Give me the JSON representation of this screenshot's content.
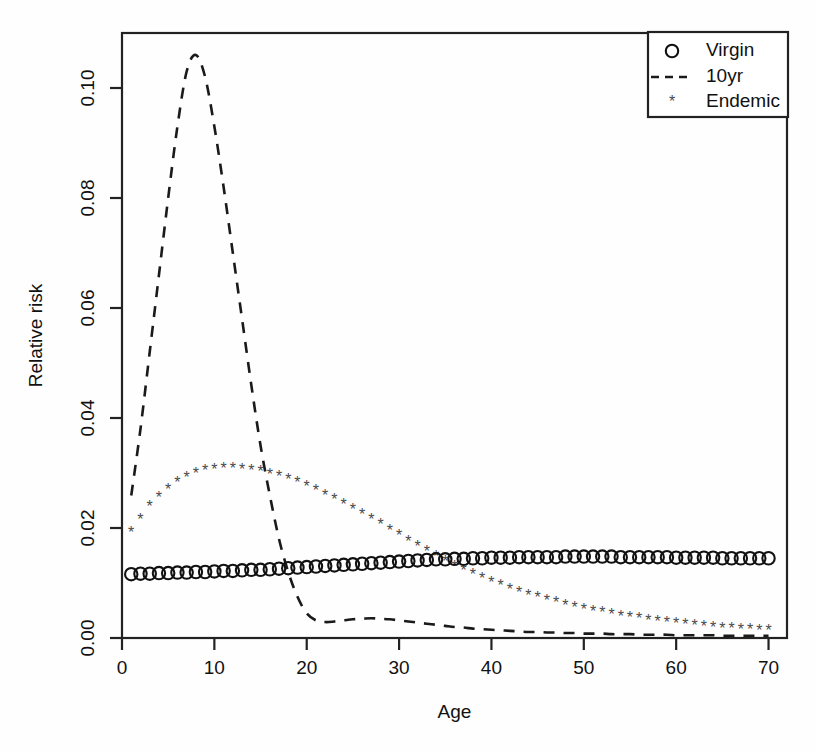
{
  "chart_data": {
    "type": "line",
    "title": "",
    "xlabel": "Age",
    "ylabel": "Relative risk",
    "xlim": [
      0,
      72
    ],
    "ylim": [
      0.0,
      0.11
    ],
    "xticks": [
      0,
      10,
      20,
      30,
      40,
      50,
      60,
      70
    ],
    "xtick_labels": [
      "0",
      "10",
      "20",
      "30",
      "40",
      "50",
      "60",
      "70"
    ],
    "yticks": [
      0.0,
      0.02,
      0.04,
      0.06,
      0.08,
      0.1
    ],
    "ytick_labels": [
      "0.00",
      "0.02",
      "0.04",
      "0.06",
      "0.08",
      "0.10"
    ],
    "grid": false,
    "legend_position": "top-right",
    "legend": [
      {
        "label": "Virgin",
        "marker": "circle",
        "style": "points",
        "color": "#111111"
      },
      {
        "label": "10yr",
        "marker": "none",
        "style": "dashed-line",
        "color": "#111111"
      },
      {
        "label": "Endemic",
        "marker": "asterisk",
        "style": "points",
        "color": "#4a4a4a"
      }
    ],
    "x": [
      1,
      2,
      3,
      4,
      5,
      6,
      7,
      8,
      9,
      10,
      11,
      12,
      13,
      14,
      15,
      16,
      17,
      18,
      19,
      20,
      21,
      22,
      23,
      24,
      25,
      26,
      27,
      28,
      29,
      30,
      31,
      32,
      33,
      34,
      35,
      36,
      37,
      38,
      39,
      40,
      41,
      42,
      43,
      44,
      45,
      46,
      47,
      48,
      49,
      50,
      51,
      52,
      53,
      54,
      55,
      56,
      57,
      58,
      59,
      60,
      61,
      62,
      63,
      64,
      65,
      66,
      67,
      68,
      69,
      70
    ],
    "series": [
      {
        "name": "Virgin",
        "marker": "circle",
        "values": [
          0.0116,
          0.0117,
          0.0117,
          0.0118,
          0.0118,
          0.0119,
          0.0119,
          0.012,
          0.012,
          0.0121,
          0.0122,
          0.0122,
          0.0123,
          0.0124,
          0.0124,
          0.0125,
          0.0126,
          0.0127,
          0.0128,
          0.0129,
          0.013,
          0.0131,
          0.0132,
          0.0133,
          0.0134,
          0.0135,
          0.0136,
          0.0137,
          0.0138,
          0.0139,
          0.014,
          0.0141,
          0.0142,
          0.0143,
          0.0143,
          0.0144,
          0.0144,
          0.0145,
          0.0145,
          0.0146,
          0.0146,
          0.0146,
          0.0147,
          0.0147,
          0.0147,
          0.0147,
          0.0147,
          0.0148,
          0.0148,
          0.0148,
          0.0148,
          0.0148,
          0.0148,
          0.0147,
          0.0147,
          0.0147,
          0.0147,
          0.0147,
          0.0147,
          0.0146,
          0.0146,
          0.0146,
          0.0146,
          0.0146,
          0.0145,
          0.0145,
          0.0145,
          0.0145,
          0.0145,
          0.0145
        ]
      },
      {
        "name": "10yr",
        "marker": "none",
        "values": [
          0.0259,
          0.038,
          0.052,
          0.066,
          0.08,
          0.093,
          0.103,
          0.106,
          0.102,
          0.093,
          0.082,
          0.07,
          0.058,
          0.046,
          0.035,
          0.026,
          0.018,
          0.012,
          0.0075,
          0.0045,
          0.0032,
          0.0029,
          0.003,
          0.0032,
          0.0034,
          0.0035,
          0.0036,
          0.0035,
          0.0034,
          0.0032,
          0.003,
          0.0028,
          0.0026,
          0.0024,
          0.0022,
          0.002,
          0.0019,
          0.0017,
          0.0016,
          0.0015,
          0.0014,
          0.0013,
          0.0012,
          0.0011,
          0.0011,
          0.001,
          0.001,
          0.0009,
          0.0009,
          0.0008,
          0.0008,
          0.0008,
          0.0007,
          0.0007,
          0.0007,
          0.0006,
          0.0006,
          0.0006,
          0.0006,
          0.0005,
          0.0005,
          0.0005,
          0.0005,
          0.0005,
          0.0004,
          0.0004,
          0.0004,
          0.0004,
          0.0004,
          0.0004
        ]
      },
      {
        "name": "Endemic",
        "marker": "asterisk",
        "values": [
          0.0191,
          0.0215,
          0.0238,
          0.0255,
          0.027,
          0.0282,
          0.0291,
          0.0298,
          0.0303,
          0.0306,
          0.0307,
          0.0307,
          0.0306,
          0.0304,
          0.0301,
          0.0297,
          0.0292,
          0.0287,
          0.0281,
          0.0274,
          0.0267,
          0.0259,
          0.0251,
          0.0242,
          0.0233,
          0.0224,
          0.0214,
          0.0205,
          0.0195,
          0.0185,
          0.0175,
          0.0165,
          0.0156,
          0.0147,
          0.0138,
          0.013,
          0.0122,
          0.0114,
          0.0107,
          0.01,
          0.0094,
          0.0088,
          0.0082,
          0.0077,
          0.0072,
          0.0067,
          0.0063,
          0.0059,
          0.0055,
          0.0051,
          0.0048,
          0.0045,
          0.0042,
          0.0039,
          0.0036,
          0.0034,
          0.0031,
          0.0029,
          0.0027,
          0.0025,
          0.0023,
          0.0022,
          0.002,
          0.0019,
          0.0017,
          0.0016,
          0.0015,
          0.0014,
          0.0013,
          0.0012
        ]
      }
    ]
  }
}
